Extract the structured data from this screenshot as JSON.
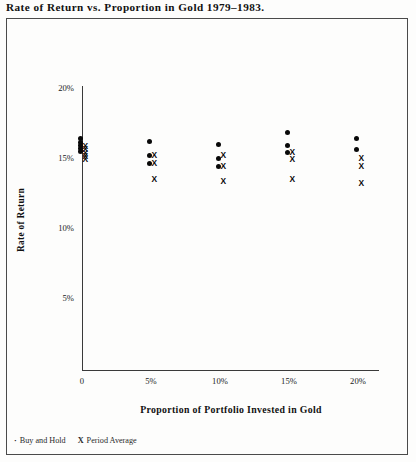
{
  "chart_title": "Rate of Return vs. Proportion in Gold 1979–1983.",
  "axes": {
    "x_title": "Proportion of Portfolio Invested in Gold",
    "y_title": "Rate of Return",
    "x_ticks": [
      "0",
      "5%",
      "10%",
      "15%",
      "20%"
    ],
    "y_ticks": [
      "5%",
      "10%",
      "15%",
      "20%"
    ]
  },
  "legend": {
    "items": [
      {
        "marker": "·",
        "label": "Buy and Hold"
      },
      {
        "marker": "X",
        "label": "Period Average"
      }
    ]
  },
  "chart_data": {
    "type": "scatter",
    "title": "Rate of Return vs. Proportion in Gold 1979–1983.",
    "xlabel": "Proportion of Portfolio Invested in Gold",
    "ylabel": "Rate of Return",
    "xlim": [
      0,
      21.5
    ],
    "ylim": [
      3.0,
      20.6
    ],
    "x_tick_values": [
      0,
      5,
      10,
      15,
      20
    ],
    "x_tick_labels": [
      "0",
      "5%",
      "10%",
      "15%",
      "20%"
    ],
    "y_tick_values": [
      5,
      10,
      15,
      20
    ],
    "y_tick_labels": [
      "5%",
      "10%",
      "15%",
      "20%"
    ],
    "grid": false,
    "legend_position": "below-plot-left",
    "series": [
      {
        "name": "Buy and Hold",
        "marker": "dot",
        "points": [
          {
            "x": 0,
            "y": 16.4
          },
          {
            "x": 0,
            "y": 16.1
          },
          {
            "x": 0,
            "y": 15.9
          },
          {
            "x": 0,
            "y": 15.7
          },
          {
            "x": 0,
            "y": 15.5
          },
          {
            "x": 5,
            "y": 16.2
          },
          {
            "x": 5,
            "y": 15.2
          },
          {
            "x": 5,
            "y": 14.6
          },
          {
            "x": 10,
            "y": 16.0
          },
          {
            "x": 10,
            "y": 15.0
          },
          {
            "x": 10,
            "y": 14.4
          },
          {
            "x": 15,
            "y": 16.8
          },
          {
            "x": 15,
            "y": 15.9
          },
          {
            "x": 15,
            "y": 15.4
          },
          {
            "x": 20,
            "y": 16.4
          },
          {
            "x": 20,
            "y": 15.6
          }
        ]
      },
      {
        "name": "Period Average",
        "marker": "x",
        "points": [
          {
            "x": 0,
            "y": 15.8
          },
          {
            "x": 0,
            "y": 15.6
          },
          {
            "x": 0,
            "y": 15.3
          },
          {
            "x": 0,
            "y": 15.1
          },
          {
            "x": 0,
            "y": 14.9
          },
          {
            "x": 5,
            "y": 15.2
          },
          {
            "x": 5,
            "y": 14.6
          },
          {
            "x": 5,
            "y": 13.5
          },
          {
            "x": 10,
            "y": 15.2
          },
          {
            "x": 10,
            "y": 14.4
          },
          {
            "x": 10,
            "y": 13.3
          },
          {
            "x": 15,
            "y": 15.4
          },
          {
            "x": 15,
            "y": 14.9
          },
          {
            "x": 15,
            "y": 13.5
          },
          {
            "x": 20,
            "y": 15.0
          },
          {
            "x": 20,
            "y": 14.4
          },
          {
            "x": 20,
            "y": 13.2
          }
        ]
      }
    ]
  }
}
